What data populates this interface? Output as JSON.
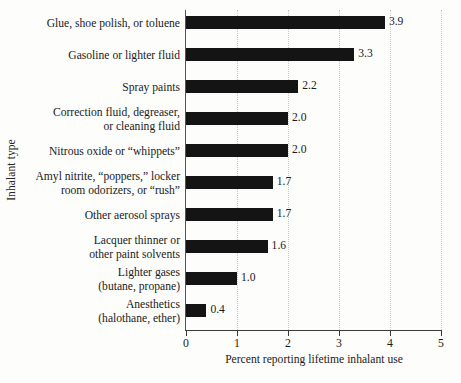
{
  "chart_data": {
    "type": "bar",
    "orientation": "horizontal",
    "title": "",
    "xlabel": "Percent reporting lifetime inhalant use",
    "ylabel": "Inhalant type",
    "xlim": [
      0,
      5
    ],
    "xticks": [
      "0",
      "1",
      "2",
      "3",
      "4",
      "5"
    ],
    "grid": "vertical-dotted",
    "legend": "none",
    "bar_color": "#141414",
    "categories": [
      "Glue, shoe polish, or toluene",
      "Gasoline or lighter fluid",
      "Spray paints",
      "Correction fluid, degreaser,\nor cleaning fluid",
      "Nitrous oxide or “whippets”",
      "Amyl nitrite, “poppers,” locker\nroom odorizers, or “rush”",
      "Other aerosol sprays",
      "Lacquer thinner or\nother paint solvents",
      "Lighter gases\n(butane, propane)",
      "Anesthetics\n(halothane, ether)"
    ],
    "values": [
      3.9,
      3.3,
      2.2,
      2.0,
      2.0,
      1.7,
      1.7,
      1.6,
      1.0,
      0.4
    ],
    "value_labels": [
      "3.9",
      "3.3",
      "2.2",
      "2.0",
      "2.0",
      "1.7",
      "1.7",
      "1.6",
      "1.0",
      "0.4"
    ]
  }
}
